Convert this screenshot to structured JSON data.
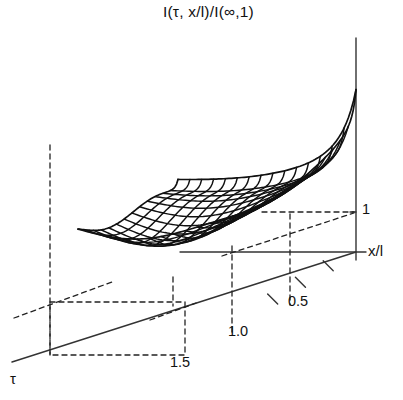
{
  "chart_data": {
    "type": "line",
    "render": "wireframe-surface-3d",
    "title": "I(τ, x/l)/I(∞,1)",
    "xlabel": "x/l",
    "ylabel": "τ",
    "zlabel": "I(τ, x/l)/I(∞,1)",
    "axes": {
      "vertical_axis_label": "1",
      "horizontal_axis_label": "x/l",
      "depth_axis_label": "τ",
      "grid": false,
      "legend": false
    },
    "tick_labels": {
      "depth_axis": [
        "0.5",
        "1.0",
        "1.5"
      ],
      "vertical_axis": [
        "1"
      ]
    },
    "depth_ticks_values": [
      0.5,
      1.0,
      1.5
    ],
    "vertical_ticks_values": [
      1
    ],
    "xlim": [
      0,
      1
    ],
    "ylim": [
      0,
      1.8
    ],
    "zlim": [
      0,
      1.55
    ],
    "surface": {
      "u_lines": 16,
      "v_lines": 14,
      "description": "valley shaped surface rising steeply at small tau and at small x/l, flattening to value 1 at large tau and x/l = 1",
      "samples_u": [
        0,
        0.0667,
        0.1333,
        0.2,
        0.2667,
        0.3333,
        0.4,
        0.4667,
        0.5333,
        0.6,
        0.6667,
        0.7333,
        0.8,
        0.8667,
        0.9333,
        1
      ],
      "samples_v": [
        0,
        0.0769,
        0.1538,
        0.2308,
        0.3077,
        0.3846,
        0.4615,
        0.5385,
        0.6154,
        0.6923,
        0.7692,
        0.8462,
        0.9231,
        1
      ]
    },
    "colors": {
      "line": "#111111",
      "axis": "#333333",
      "dashed": "#222222",
      "background": "#ffffff"
    }
  },
  "labels": {
    "title": "I(τ, x/l)/I(∞,1)",
    "axis_x": "x/l",
    "axis_tau": "τ",
    "tick_one": "1",
    "tick_05": "0.5",
    "tick_10": "1.0",
    "tick_15": "1.5"
  }
}
